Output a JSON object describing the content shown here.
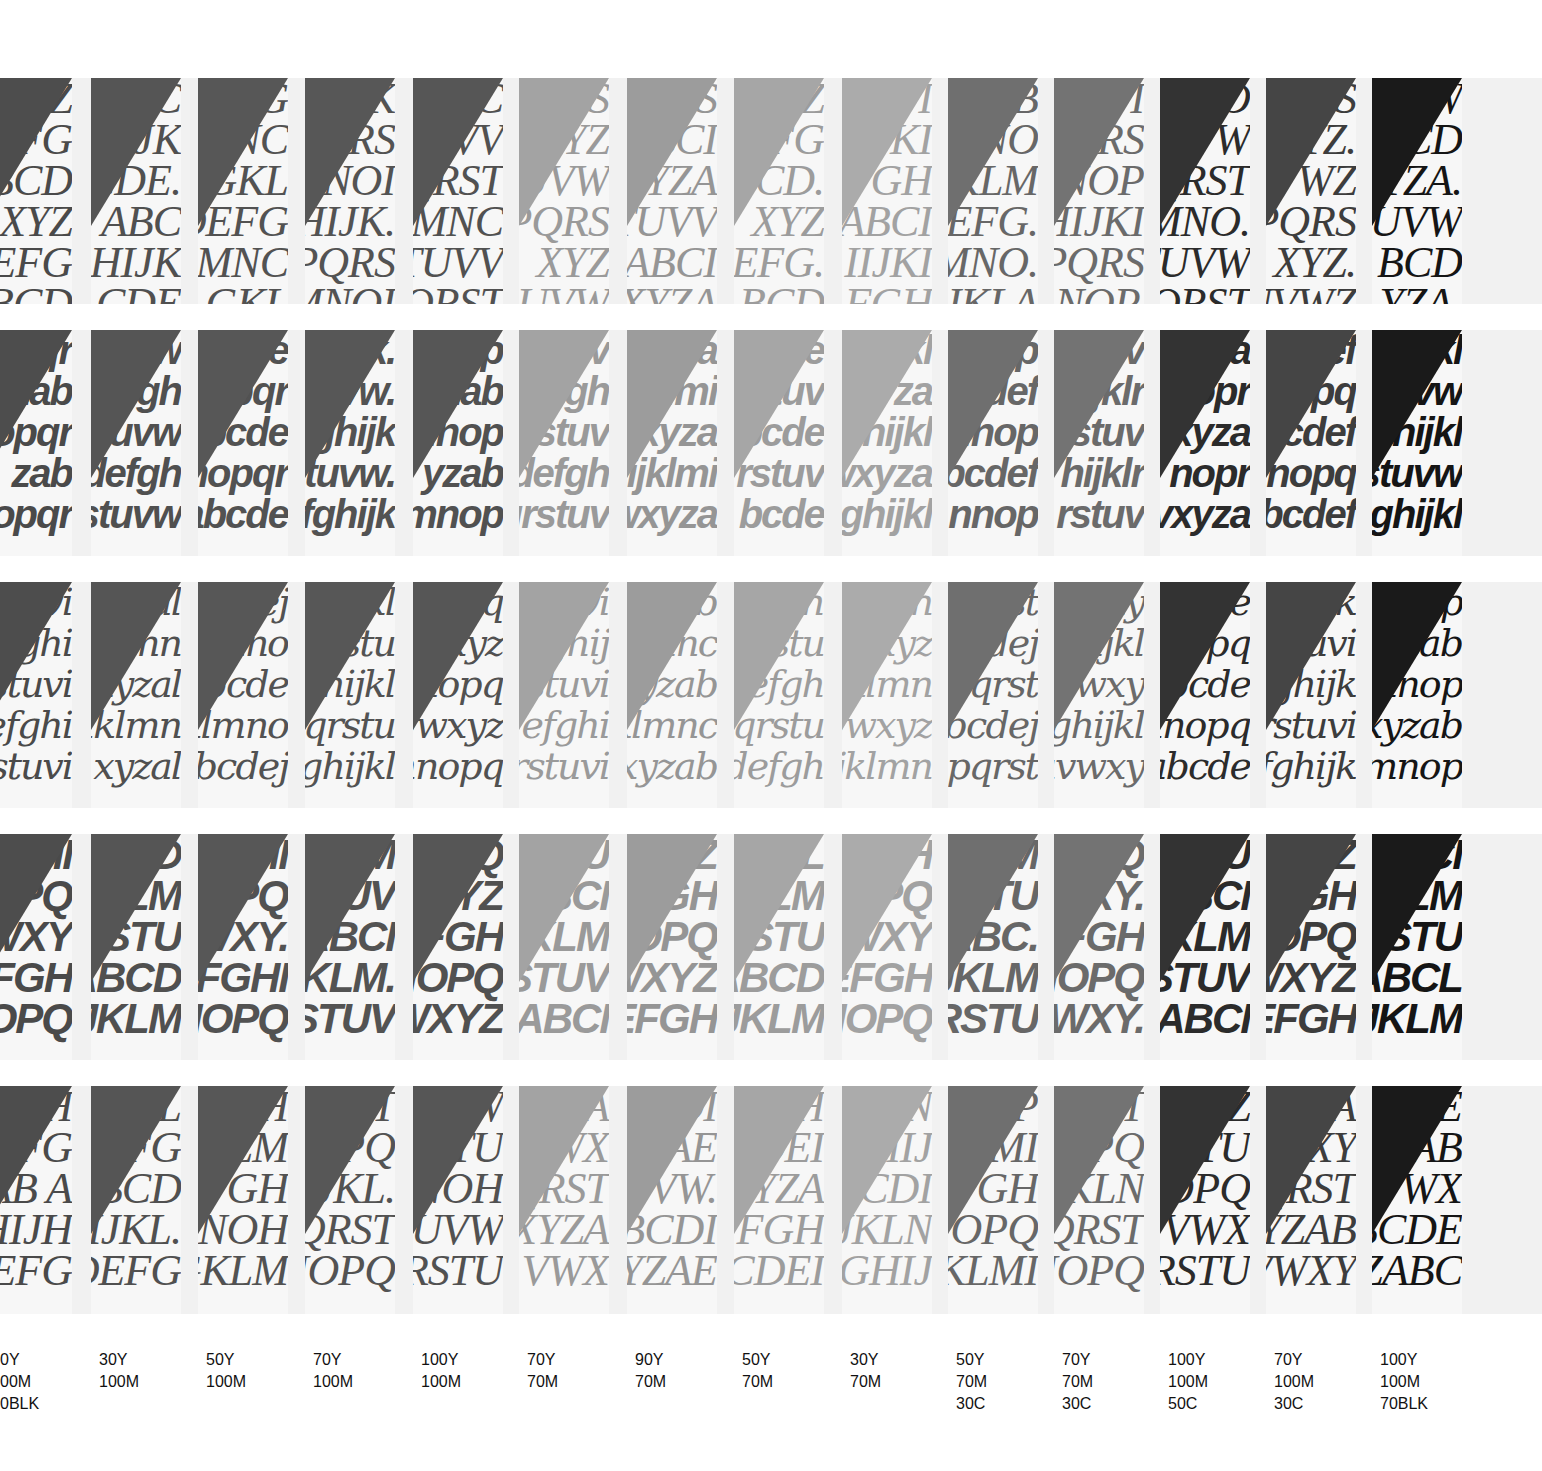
{
  "columns": [
    {
      "x": -18,
      "ink": "#4d4d4d",
      "text": "#4a4a4a",
      "label": [
        "0Y",
        "00M",
        "0BLK"
      ]
    },
    {
      "x": 91,
      "ink": "#555555",
      "text": "#505050",
      "label": [
        "30Y",
        "100M"
      ]
    },
    {
      "x": 198,
      "ink": "#575757",
      "text": "#525252",
      "label": [
        "50Y",
        "100M"
      ]
    },
    {
      "x": 305,
      "ink": "#575757",
      "text": "#535353",
      "label": [
        "70Y",
        "100M"
      ]
    },
    {
      "x": 413,
      "ink": "#565656",
      "text": "#515151",
      "label": [
        "100Y",
        "100M"
      ]
    },
    {
      "x": 519,
      "ink": "#a3a3a3",
      "text": "#9a9a9a",
      "label": [
        "70Y",
        "70M"
      ]
    },
    {
      "x": 627,
      "ink": "#9c9c9c",
      "text": "#959595",
      "label": [
        "90Y",
        "70M"
      ]
    },
    {
      "x": 734,
      "ink": "#a6a6a6",
      "text": "#9c9c9c",
      "label": [
        "50Y",
        "70M"
      ]
    },
    {
      "x": 842,
      "ink": "#ababab",
      "text": "#a2a2a2",
      "label": [
        "30Y",
        "70M"
      ]
    },
    {
      "x": 948,
      "ink": "#6f6f6f",
      "text": "#676767",
      "label": [
        "50Y",
        "70M",
        "30C"
      ]
    },
    {
      "x": 1054,
      "ink": "#737373",
      "text": "#6b6b6b",
      "label": [
        "70Y",
        "70M",
        "30C"
      ]
    },
    {
      "x": 1160,
      "ink": "#333333",
      "text": "#2b2b2b",
      "label": [
        "100Y",
        "100M",
        "50C"
      ]
    },
    {
      "x": 1266,
      "ink": "#454545",
      "text": "#3d3d3d",
      "label": [
        "70Y",
        "100M",
        "30C"
      ]
    },
    {
      "x": 1372,
      "ink": "#1a1a1a",
      "text": "#151515",
      "label": [
        "100Y",
        "100M",
        "70BLK"
      ]
    }
  ],
  "rows": [
    {
      "name": "serif-italic-capitals",
      "top": 78,
      "height": 226,
      "style": "style-serif-caps",
      "cells": [
        [
          "Z",
          "EFG",
          "BCD",
          "XYZ",
          "EFG",
          "BCD"
        ],
        [
          "C",
          "HIJK",
          "CDE.",
          "ABC",
          "HIJK",
          "CDE"
        ],
        [
          "G",
          "MNC",
          "GKL",
          "DEFG",
          "MNC",
          "GKL"
        ],
        [
          "K",
          "PQRS",
          "MNOI",
          "HIJK.",
          "PQRS",
          "MNOI"
        ],
        [
          "C",
          "TUVV",
          "QRST",
          "MNC",
          "TUVV",
          "QRST"
        ],
        [
          "S",
          "XYZ",
          "UVW",
          "PQRS",
          "XYZ",
          "UVW"
        ],
        [
          "S",
          "BCI",
          "XYZA",
          "TUVV",
          "ABCI",
          "XYZA"
        ],
        [
          "Z",
          "FG",
          "BCD.",
          "XYZ",
          "EFG.",
          "BCD"
        ],
        [
          "I",
          "JKI",
          "FGH",
          "ABCI",
          "IIJKI",
          "FGH"
        ],
        [
          "B",
          "NO",
          "JKLM",
          "EFG.",
          "MNO.",
          "JKLA"
        ],
        [
          "I",
          "RS",
          "NOP",
          "HIJKI",
          "PQRS",
          "NOP."
        ],
        [
          "O",
          "VW",
          "QRST",
          "MNO.",
          "TUVW",
          "QRST"
        ],
        [
          "S",
          "YZ.",
          "UVWZ",
          "PQRS",
          "XYZ.",
          "UVWZ"
        ],
        [
          "W",
          "CD",
          "YZA.",
          "TUVW",
          "BCD",
          "YZA."
        ]
      ]
    },
    {
      "name": "sans-italic-lowercase",
      "top": 330,
      "height": 226,
      "style": "style-sans-lower",
      "cells": [
        [
          "qr",
          "zab",
          "opqr",
          "zab",
          "opqr"
        ],
        [
          "w",
          "efgh",
          "stuvw",
          "defgh",
          "stuvw"
        ],
        [
          "de",
          "opqr",
          "abcde",
          "nopqr",
          "abcde"
        ],
        [
          "k.",
          "uvw.",
          "fghijk",
          "stuvw.",
          "fghijk"
        ],
        [
          "p",
          "zab",
          "mnop",
          "yzab",
          "mnop"
        ],
        [
          "uv",
          "efgh",
          "qrstuv",
          "defgh",
          "qrstuv"
        ],
        [
          "za",
          "klmi",
          "wxyza",
          "ijklmi",
          "wxyza"
        ],
        [
          "e",
          "stuv",
          "bcde",
          "rstuv",
          "bcde"
        ],
        [
          "kl",
          "xyza",
          "ghijkl",
          "wxyza",
          "ghijkl"
        ],
        [
          "p",
          "cdef",
          "nnop",
          "bcdef",
          "nnop"
        ],
        [
          "v",
          "ijklr",
          "rstuv",
          "hijklr",
          "rstuv"
        ],
        [
          "za",
          "nopr",
          "vxyza",
          "nopr",
          "vxyza"
        ],
        [
          "ef",
          "opq",
          "bcdef",
          "nopq",
          "bcdef"
        ],
        [
          "kl",
          "tuvw",
          "ghijkl",
          "rstuvw",
          "ghijkl"
        ]
      ]
    },
    {
      "name": "serif-italic-lowercase",
      "top": 582,
      "height": 226,
      "style": "style-serif-lower",
      "cells": [
        [
          "vi",
          "efghi",
          "stuvi",
          "efghi",
          "stuvi"
        ],
        [
          "al",
          "klmn",
          "xyzal",
          "iklmn",
          "xyzal"
        ],
        [
          "dej",
          "mno",
          "abcde",
          "klmno",
          "abcdej"
        ],
        [
          "jkl",
          "qrstu",
          "ghijkl",
          "pqrstu",
          "ghijkl"
        ],
        [
          "pq",
          "wxyz",
          "nnopq",
          "vwxyz",
          "nnopq"
        ],
        [
          "vi",
          "fghij",
          "rstuvi",
          "defghi",
          "rstuvi"
        ],
        [
          "ab",
          "mnc",
          "xyzab",
          "klmnc",
          "xyzab"
        ],
        [
          "gh",
          "qrstu",
          "defgh",
          "pqrstu",
          "defgh"
        ],
        [
          "nn",
          "wxyz",
          "jklmn",
          "vwxyz",
          "jklmn"
        ],
        [
          "st",
          "bcdej",
          "opqrst",
          "abcdej",
          "opqrst"
        ],
        [
          "xy",
          "bijkl",
          "uvwxy",
          "ghijkl",
          "uvwxy"
        ],
        [
          "de",
          "nopq",
          "zabcde",
          "nnopq",
          "zabcde"
        ],
        [
          "jk",
          "tuvi",
          "fghijk",
          "rstuvi",
          "fghijk"
        ],
        [
          "op",
          "yzab",
          "mnop",
          "xyzab",
          "mnop"
        ]
      ]
    },
    {
      "name": "sans-italic-capitals",
      "top": 834,
      "height": 226,
      "style": "style-sans-caps",
      "cells": [
        [
          "HI",
          "NOPQ",
          "WXY",
          "EFGH",
          "NOPQ"
        ],
        [
          "D",
          "KLM",
          "RSTU",
          "ABCD",
          "JKLM"
        ],
        [
          "HI",
          "OPQ",
          "WXY.",
          "EFGHI",
          "NOPQ"
        ],
        [
          "M",
          "STUV",
          "ABCI",
          "JKLM.",
          "RSTUV"
        ],
        [
          "Q",
          "WXYZ",
          "DEFGH",
          "NOPQ",
          "WXYZ"
        ],
        [
          "U",
          "ABCI",
          "IJKLM",
          "RSTUV",
          "ABCI"
        ],
        [
          "Z",
          "EFGH",
          "NOPQ",
          "WXYZ",
          "EFGH"
        ],
        [
          "L",
          "KLM",
          "RSTU",
          "ABCD",
          "JKLM"
        ],
        [
          "H",
          "OPQ",
          "VWXY",
          "EFGH",
          "NOPQ"
        ],
        [
          "M",
          "STU",
          "ZABC.",
          "JKLM",
          "RSTU"
        ],
        [
          "Q",
          "WXY.",
          "DEFGH",
          "NOPQ",
          "WXY."
        ],
        [
          "U",
          "ABCI",
          "IJKLM",
          "RSTUV",
          "ZABCI"
        ],
        [
          "Z",
          "EFGH",
          "NOPQ",
          "WXYZ",
          "DEFGH"
        ],
        [
          "CI",
          "KLM",
          "RSTU",
          "ABCL",
          "IJKLM"
        ]
      ]
    },
    {
      "name": "serif-italic-capitals-2",
      "top": 1086,
      "height": 228,
      "style": "style-serif-caps2",
      "cells": [
        [
          "JH",
          "EFG",
          "AB A",
          "HIJH",
          "EFG"
        ],
        [
          "KL",
          "DEFG",
          "ABCD",
          "IJKL.",
          "DEFG"
        ],
        [
          "OH",
          "KLM",
          "EFGH",
          "MNOH",
          "GKLM"
        ],
        [
          "ST",
          "NOPQ",
          "IJKL.",
          "QRST",
          "NOPQ"
        ],
        [
          "W",
          "RSTU",
          "MNOH",
          "UVW",
          "RSTU"
        ],
        [
          "LA",
          "VWX",
          "QRST",
          "XYZA",
          "VWX"
        ],
        [
          "DI",
          "YZAE",
          "UVW.",
          "BCDI",
          "YZAE"
        ],
        [
          "H",
          "CDEI",
          "XYZA",
          "FGH",
          "CDEI"
        ],
        [
          "LN",
          "GHIJ",
          "BCDI",
          "JKLN",
          "GHIJ"
        ],
        [
          "P",
          "KLMI",
          "FGH",
          "NOPQ",
          "KLMI"
        ],
        [
          "ST",
          "OPQ",
          "JKLN",
          "QRST",
          "NOPQ"
        ],
        [
          "WZ",
          "STU",
          "NOPQ",
          "UVWX",
          "RSTU"
        ],
        [
          "ZA",
          "WXY",
          "QRST",
          "YZAB",
          "VWXY"
        ],
        [
          "DE",
          "ZAB",
          "UVWX",
          "BCDE",
          "ZABC"
        ]
      ]
    }
  ],
  "bands": [
    {
      "top": 78,
      "height": 226
    },
    {
      "top": 330,
      "height": 226
    },
    {
      "top": 582,
      "height": 226
    },
    {
      "top": 834,
      "height": 226
    },
    {
      "top": 1086,
      "height": 228
    }
  ],
  "labels_top": 1349
}
